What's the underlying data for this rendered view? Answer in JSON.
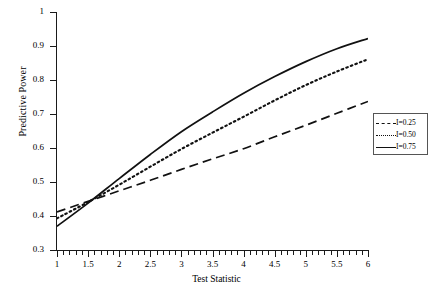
{
  "chart_data": {
    "type": "line",
    "title": "",
    "xlabel": "Test Statistic",
    "ylabel": "Predictive Power",
    "xlim": [
      1,
      6
    ],
    "ylim": [
      0.3,
      1
    ],
    "grid": false,
    "legend_position": "right-outside",
    "xticks": [
      "1",
      "1.5",
      "2",
      "2.5",
      "3",
      "3.5",
      "4",
      "4.5",
      "5",
      "5.5",
      "6"
    ],
    "xtick_values": [
      1,
      1.5,
      2,
      2.5,
      3,
      3.5,
      4,
      4.5,
      5,
      5.5,
      6
    ],
    "yticks": [
      "0.3",
      "0.4",
      "0.5",
      "0.6",
      "0.7",
      "0.8",
      "0.9",
      "1"
    ],
    "ytick_values": [
      0.3,
      0.4,
      0.5,
      0.6,
      0.7,
      0.8,
      0.9,
      1
    ],
    "x": [
      1,
      1.5,
      2,
      2.5,
      3,
      3.5,
      4,
      4.5,
      5,
      5.5,
      6
    ],
    "series": [
      {
        "name": "I=0.25",
        "style": "dashed",
        "color": "#111111",
        "values": [
          0.412,
          0.443,
          0.474,
          0.505,
          0.537,
          0.568,
          0.598,
          0.633,
          0.667,
          0.702,
          0.737
        ]
      },
      {
        "name": "I=0.50",
        "style": "dotted",
        "color": "#111111",
        "values": [
          0.393,
          0.441,
          0.492,
          0.545,
          0.597,
          0.645,
          0.692,
          0.74,
          0.785,
          0.825,
          0.861
        ]
      },
      {
        "name": "I=0.75",
        "style": "solid",
        "color": "#111111",
        "values": [
          0.37,
          0.438,
          0.51,
          0.581,
          0.648,
          0.706,
          0.761,
          0.81,
          0.854,
          0.892,
          0.922
        ]
      }
    ]
  },
  "legend": {
    "entries": [
      {
        "label": "I=0.25",
        "key": "dashed-line-key"
      },
      {
        "label": "I=0.50",
        "key": "dotted-line-key"
      },
      {
        "label": "I=0.75",
        "key": "solid-line-key"
      }
    ]
  }
}
